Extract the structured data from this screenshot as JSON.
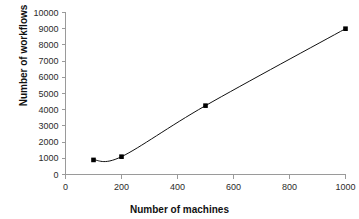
{
  "chart_data": {
    "type": "line",
    "title": "",
    "xlabel": "Number of machines",
    "ylabel": "Number of workflows",
    "xlim": [
      0,
      1000
    ],
    "ylim": [
      0,
      10000
    ],
    "grid": false,
    "legend": "none",
    "marker": "square",
    "line_color": "#111111",
    "marker_color": "#000000",
    "axis_color": "#9a9a9a",
    "background": "#ffffff",
    "x": [
      100,
      200,
      500,
      1000
    ],
    "values": [
      900,
      1100,
      4250,
      9000
    ],
    "series": [
      {
        "name": "workflows",
        "points": [
          {
            "x": 100,
            "y": 900
          },
          {
            "x": 200,
            "y": 1100
          },
          {
            "x": 500,
            "y": 4250
          },
          {
            "x": 1000,
            "y": 9000
          }
        ]
      }
    ],
    "xticks": [
      0,
      200,
      400,
      600,
      800,
      1000
    ],
    "xtick_labels": [
      "0",
      "200",
      "400",
      "600",
      "800",
      "1000"
    ],
    "yticks": [
      0,
      1000,
      2000,
      3000,
      4000,
      5000,
      6000,
      7000,
      8000,
      9000,
      10000
    ],
    "ytick_labels": [
      "0",
      "1000",
      "2000",
      "3000",
      "4000",
      "5000",
      "6000",
      "7000",
      "8000",
      "9000",
      "10000"
    ]
  }
}
